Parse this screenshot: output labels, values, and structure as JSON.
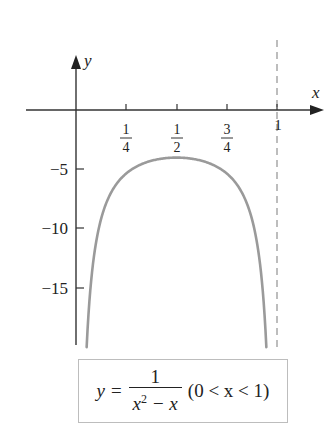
{
  "chart_data": {
    "type": "line",
    "title": "",
    "xlabel": "x",
    "ylabel": "y",
    "x_ticks": [
      {
        "value": 0.25,
        "num": "1",
        "den": "4"
      },
      {
        "value": 0.5,
        "num": "1",
        "den": "2"
      },
      {
        "value": 0.75,
        "num": "3",
        "den": "4"
      },
      {
        "value": 1,
        "label": "1"
      }
    ],
    "y_ticks": [
      {
        "value": -5,
        "label": "−5"
      },
      {
        "value": -10,
        "label": "−10"
      },
      {
        "value": -15,
        "label": "−15"
      }
    ],
    "xlim": [
      -0.37,
      1.22
    ],
    "ylim": [
      -19.8,
      4.6
    ],
    "grid": false,
    "asymptote": {
      "x": 1,
      "style": "dashed"
    },
    "series": [
      {
        "name": "y = 1/(x^2 - x)",
        "color": "#9a9a9a",
        "x": [
          0.053,
          0.06,
          0.08,
          0.1,
          0.15,
          0.2,
          0.25,
          0.3,
          0.35,
          0.4,
          0.45,
          0.5,
          0.55,
          0.6,
          0.65,
          0.7,
          0.75,
          0.8,
          0.85,
          0.9,
          0.92,
          0.94,
          0.947
        ],
        "y": [
          -19.92,
          -17.73,
          -13.59,
          -11.11,
          -7.84,
          -6.25,
          -5.33,
          -4.76,
          -4.4,
          -4.17,
          -4.04,
          -4.0,
          -4.04,
          -4.17,
          -4.4,
          -4.76,
          -5.33,
          -6.25,
          -7.84,
          -11.11,
          -13.59,
          -17.73,
          -19.92
        ]
      }
    ],
    "annotation": {
      "lhs": "y =",
      "numerator": "1",
      "denominator_base": "x",
      "denominator_exp": "2",
      "denominator_rest": " − x",
      "domain": "(0 < x < 1)"
    }
  }
}
